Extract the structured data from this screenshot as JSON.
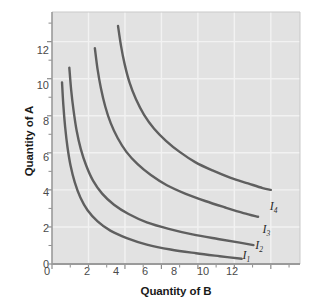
{
  "chart_data": {
    "type": "line",
    "title": "",
    "subtitle": "",
    "xlabel": "Quantity of B",
    "ylabel": "Quantity of A",
    "xlim": [
      0,
      13.6
    ],
    "ylim": [
      0,
      13.6
    ],
    "xticks": [
      0,
      2,
      4,
      6,
      8,
      10,
      12
    ],
    "xtick_labels": [
      "0",
      "2",
      "4",
      "6",
      "8",
      "10",
      "12"
    ],
    "yticks": [
      0,
      2,
      4,
      6,
      8,
      10,
      12
    ],
    "ytick_labels": [
      "0",
      "2",
      "4",
      "6",
      "8",
      "10",
      "12"
    ],
    "grid": true,
    "grid_color": "#f2f2f2",
    "plot_background": "#e2e2e2",
    "figure_background": "#ffffff",
    "curve_color": "#5f5f5f",
    "axis_color": "#8c8c8c",
    "legend_position": "inline-right-of-curve-ends",
    "annotations": [
      {
        "text": "I",
        "sub": "4",
        "x": 12.05,
        "y": 3.05
      },
      {
        "text": "I",
        "sub": "3",
        "x": 11.65,
        "y": 1.82
      },
      {
        "text": "I",
        "sub": "2",
        "x": 11.25,
        "y": 0.98
      },
      {
        "text": "I",
        "sub": "1",
        "x": 10.55,
        "y": 0.42
      }
    ],
    "series": [
      {
        "name": "I1",
        "label": "I₁",
        "points": [
          [
            0.55,
            9.8
          ],
          [
            0.62,
            8.6
          ],
          [
            0.72,
            7.4
          ],
          [
            0.85,
            6.3
          ],
          [
            1.02,
            5.3
          ],
          [
            1.25,
            4.4
          ],
          [
            1.55,
            3.6
          ],
          [
            1.95,
            2.9
          ],
          [
            2.5,
            2.3
          ],
          [
            3.2,
            1.8
          ],
          [
            4.1,
            1.4
          ],
          [
            5.2,
            1.05
          ],
          [
            6.5,
            0.78
          ],
          [
            7.9,
            0.58
          ],
          [
            9.2,
            0.42
          ],
          [
            10.4,
            0.28
          ]
        ]
      },
      {
        "name": "I2",
        "label": "I₂",
        "points": [
          [
            0.95,
            10.6
          ],
          [
            1.05,
            9.4
          ],
          [
            1.18,
            8.3
          ],
          [
            1.35,
            7.2
          ],
          [
            1.58,
            6.2
          ],
          [
            1.88,
            5.3
          ],
          [
            2.25,
            4.5
          ],
          [
            2.75,
            3.8
          ],
          [
            3.4,
            3.2
          ],
          [
            4.2,
            2.7
          ],
          [
            5.2,
            2.25
          ],
          [
            6.4,
            1.9
          ],
          [
            7.7,
            1.6
          ],
          [
            9.1,
            1.35
          ],
          [
            10.3,
            1.15
          ],
          [
            11.05,
            1.02
          ]
        ]
      },
      {
        "name": "I3",
        "label": "I₃",
        "points": [
          [
            2.35,
            11.65
          ],
          [
            2.5,
            10.5
          ],
          [
            2.68,
            9.5
          ],
          [
            2.92,
            8.5
          ],
          [
            3.22,
            7.6
          ],
          [
            3.6,
            6.8
          ],
          [
            4.08,
            6.05
          ],
          [
            4.68,
            5.4
          ],
          [
            5.42,
            4.8
          ],
          [
            6.3,
            4.25
          ],
          [
            7.3,
            3.8
          ],
          [
            8.4,
            3.4
          ],
          [
            9.5,
            3.05
          ],
          [
            10.5,
            2.75
          ],
          [
            11.3,
            2.55
          ]
        ]
      },
      {
        "name": "I4",
        "label": "I₄",
        "points": [
          [
            3.62,
            12.85
          ],
          [
            3.78,
            11.8
          ],
          [
            3.98,
            10.8
          ],
          [
            4.25,
            9.8
          ],
          [
            4.6,
            8.9
          ],
          [
            5.05,
            8.05
          ],
          [
            5.6,
            7.3
          ],
          [
            6.25,
            6.65
          ],
          [
            7.0,
            6.05
          ],
          [
            7.85,
            5.5
          ],
          [
            8.8,
            5.05
          ],
          [
            9.8,
            4.65
          ],
          [
            10.75,
            4.35
          ],
          [
            11.55,
            4.1
          ],
          [
            12.0,
            4.0
          ]
        ]
      }
    ]
  }
}
